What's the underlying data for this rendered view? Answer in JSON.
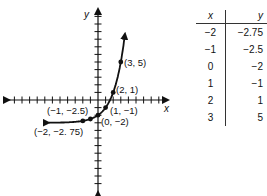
{
  "chart_data": {
    "type": "line",
    "title": "",
    "xlabel": "x",
    "ylabel": "y",
    "x": [
      -2,
      -1,
      0,
      1,
      2,
      3
    ],
    "y": [
      -2.75,
      -2.5,
      -2,
      -1,
      1,
      5
    ],
    "point_labels": [
      "(-2, -2.75)",
      "(-1, -2.5)",
      "(0, -2)",
      "(1, -1)",
      "(2, 1)",
      "(3, 5)"
    ],
    "xlim": [
      -12,
      9
    ],
    "ylim": [
      -12,
      12
    ],
    "grid": false,
    "curve": "exponential y = 2^x - 3"
  },
  "table": {
    "headers": [
      "x",
      "y"
    ],
    "rows": [
      [
        "−2",
        "−2.75"
      ],
      [
        "−1",
        "−2.5"
      ],
      [
        "0",
        "−2"
      ],
      [
        "1",
        "−1"
      ],
      [
        "2",
        "1"
      ],
      [
        "3",
        "5"
      ]
    ]
  },
  "labels": {
    "p0": "(−2, −2. 75)",
    "p1": "(−1, −2.5)",
    "p2": "(0, −2)",
    "p3": "(1, −1)",
    "p4": "(2, 1)",
    "p5": "(3, 5)",
    "x_axis": "x",
    "y_axis": "y"
  }
}
